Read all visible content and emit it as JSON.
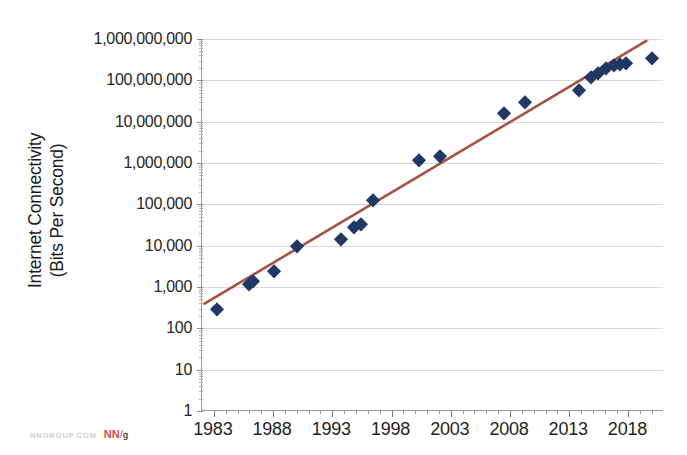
{
  "chart_data": {
    "type": "scatter",
    "title": "",
    "subtitle": "",
    "xlabel": "",
    "ylabel": "Internet Connectivity (Bits Per Second)",
    "ylabel_line1": "Internet Connectivity",
    "ylabel_line2": "(Bits Per Second)",
    "yscale": "log",
    "xlim": [
      1982,
      2021
    ],
    "ylim": [
      1,
      1000000000
    ],
    "grid": true,
    "legend": null,
    "ytick_labels": [
      "1,000,000,000",
      "100,000,000",
      "10,000,000",
      "1,000,000",
      "100,000",
      "10,000",
      "1,000",
      "100",
      "10",
      "1"
    ],
    "ytick_values": [
      1000000000,
      100000000,
      10000000,
      1000000,
      100000,
      10000,
      1000,
      100,
      10,
      1
    ],
    "xtick_labels": [
      "1983",
      "1988",
      "1993",
      "1998",
      "2003",
      "2008",
      "2013",
      "2018"
    ],
    "xtick_values": [
      1983,
      1988,
      1993,
      1998,
      2003,
      2008,
      2013,
      2018
    ],
    "marker_color": "#1f3864",
    "marker_shape": "diamond",
    "trendline_color": "#a65142",
    "gridline_color": "#d8d8d8",
    "axis_color": "#9a9a9a",
    "points": [
      {
        "x": 1983.3,
        "y": 300
      },
      {
        "x": 1986.0,
        "y": 1200
      },
      {
        "x": 1986.3,
        "y": 1400
      },
      {
        "x": 1988.1,
        "y": 2400
      },
      {
        "x": 1990.0,
        "y": 10000
      },
      {
        "x": 1993.7,
        "y": 14400
      },
      {
        "x": 1994.8,
        "y": 28800
      },
      {
        "x": 1995.4,
        "y": 33600
      },
      {
        "x": 1996.4,
        "y": 128000
      },
      {
        "x": 2000.3,
        "y": 1200000
      },
      {
        "x": 2002.1,
        "y": 1500000
      },
      {
        "x": 2007.5,
        "y": 16000000
      },
      {
        "x": 2009.3,
        "y": 30000000
      },
      {
        "x": 2013.8,
        "y": 60000000
      },
      {
        "x": 2014.8,
        "y": 120000000
      },
      {
        "x": 2015.4,
        "y": 150000000
      },
      {
        "x": 2016.1,
        "y": 200000000
      },
      {
        "x": 2016.8,
        "y": 230000000
      },
      {
        "x": 2017.3,
        "y": 250000000
      },
      {
        "x": 2017.8,
        "y": 260000000
      },
      {
        "x": 2020.0,
        "y": 350000000
      }
    ],
    "trendline": {
      "type": "exponential",
      "start": {
        "x": 1982.2,
        "y": 380
      },
      "end": {
        "x": 2019.6,
        "y": 900000000
      }
    }
  },
  "watermark": {
    "url": "NNGROUP.COM",
    "logo_nn": "NN",
    "logo_slash": "/",
    "logo_g": "g"
  }
}
